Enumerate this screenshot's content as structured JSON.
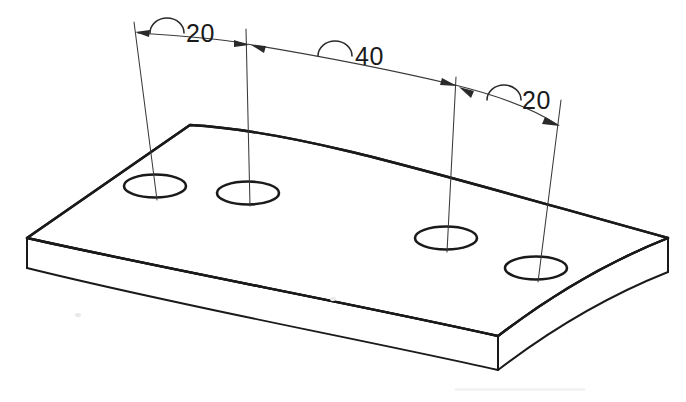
{
  "drawing": {
    "title": "Curved plate isometric view with arc-length dimensions",
    "background_color": "#ffffff",
    "line_color": "#1a1a1a",
    "dimension_line_color": "#3a3a3a"
  },
  "dimensions": [
    {
      "id": "dim-left-20",
      "value": "20",
      "symbol": "arc-length-symbol",
      "label_x": 182,
      "label_y": 40,
      "symbol_x": 150,
      "symbol_y": 33
    },
    {
      "id": "dim-middle-40",
      "value": "40",
      "symbol": "arc-length-symbol",
      "label_x": 353,
      "label_y": 63,
      "symbol_x": 318,
      "symbol_y": 56
    },
    {
      "id": "dim-right-20",
      "value": "20",
      "symbol": "arc-length-symbol",
      "label_x": 519,
      "label_y": 107,
      "symbol_x": 487,
      "symbol_y": 100
    }
  ],
  "holes": [
    {
      "id": "hole-1",
      "cx": 155,
      "cy": 186,
      "rx": 31,
      "ry": 11.5
    },
    {
      "id": "hole-2",
      "cx": 248,
      "cy": 193,
      "rx": 31,
      "ry": 11.5
    },
    {
      "id": "hole-3",
      "cx": 446,
      "cy": 238,
      "rx": 31,
      "ry": 11.5
    },
    {
      "id": "hole-4",
      "cx": 536,
      "cy": 268,
      "rx": 31,
      "ry": 11.5
    }
  ],
  "extension_lines": [
    {
      "id": "ext-hole-1",
      "x1": 134,
      "y1": 22,
      "x2": 157,
      "y2": 200
    },
    {
      "id": "ext-hole-2",
      "x1": 246,
      "y1": 29,
      "x2": 250,
      "y2": 206
    },
    {
      "id": "ext-hole-3",
      "x1": 456,
      "y1": 77,
      "x2": 447,
      "y2": 252
    },
    {
      "id": "ext-hole-4",
      "x1": 561,
      "y1": 100,
      "x2": 538,
      "y2": 282
    }
  ],
  "dimension_arc": {
    "id": "overall-arc-dimension-line",
    "start_x": 134,
    "start_y": 33,
    "end_x": 562,
    "end_y": 127,
    "description": "curved arc-length dimension line spanning all four hole centers"
  },
  "plate": {
    "description": "arc-segment plate, isometric projection, constant thickness",
    "thickness_px": 30,
    "top_face": {
      "back_left_corner_x": 190,
      "back_left_corner_y": 125,
      "left_corner_x": 27,
      "left_corner_y": 238,
      "front_corner_x": 498,
      "front_corner_y": 336,
      "right_corner_x": 668,
      "right_corner_y": 238
    }
  }
}
